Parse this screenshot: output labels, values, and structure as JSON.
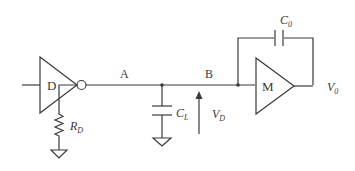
{
  "diagram": {
    "type": "circuit-schematic",
    "components": {
      "driver": {
        "label": "D",
        "kind": "inverting-buffer"
      },
      "driver_resistor": {
        "label": "R",
        "subscript": "D"
      },
      "load_capacitor": {
        "label": "C",
        "subscript": "L"
      },
      "receiver": {
        "label": "M",
        "kind": "amplifier"
      },
      "feedback_capacitor": {
        "label": "C",
        "subscript": "0"
      }
    },
    "nodes": {
      "a": {
        "label": "A"
      },
      "b": {
        "label": "B"
      }
    },
    "voltages": {
      "drive_voltage": {
        "label": "V",
        "subscript": "D"
      },
      "output_voltage": {
        "label": "V",
        "subscript": "0"
      }
    },
    "colors": {
      "stroke": "#3a3a3a",
      "background": "#ffffff"
    }
  }
}
